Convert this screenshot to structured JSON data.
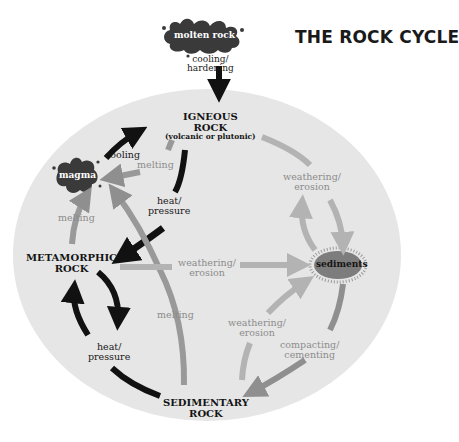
{
  "title": "THE ROCK CYCLE",
  "colors": {
    "background": "#ffffff",
    "ellipse": "#e6e6e6",
    "dark_arrow": "#111111",
    "medium_arrow": "#8f8f8f",
    "light_arrow": "#b0b0b0",
    "blob": "#3a3a3a",
    "sediments": "#7a7a7a"
  },
  "nodes": {
    "molten_rock": "molten rock",
    "igneous": {
      "line1": "IGNEOUS",
      "line2": "ROCK",
      "sub": "(volcanic or plutonic)"
    },
    "magma": "magma",
    "metamorphic": {
      "line1": "METAMORPHIC",
      "line2": "ROCK"
    },
    "sediments": "sediments",
    "sedimentary": {
      "line1": "SEDIMENTARY",
      "line2": "ROCK"
    }
  },
  "processes": {
    "cooling_hardening": {
      "line1": "cooling/",
      "line2": "hardening"
    },
    "cooling": "cooling",
    "melting_igneous": "melting",
    "heat_pressure_top": {
      "line1": "heat/",
      "line2": "pressure"
    },
    "melting_meta": "melting",
    "weathering_igneous": {
      "line1": "weathering/",
      "line2": "erosion"
    },
    "weathering_meta": {
      "line1": "weathering/",
      "line2": "erosion"
    },
    "melting_sed": "melting",
    "heat_pressure_bottom": {
      "line1": "heat/",
      "line2": "pressure"
    },
    "weathering_sed": {
      "line1": "weathering/",
      "line2": "erosion"
    },
    "compacting": {
      "line1": "compacting/",
      "line2": "cementing"
    }
  }
}
